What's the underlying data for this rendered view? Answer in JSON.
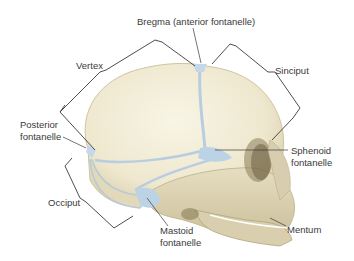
{
  "diagram": {
    "labels": {
      "bregma": "Bregma (anterior fontanelle)",
      "vertex": "Vertex",
      "sinciput": "Sinciput",
      "posterior_1": "Posterior",
      "posterior_2": "fontanelle",
      "sphenoid_1": "Sphenoid",
      "sphenoid_2": "fontanelle",
      "occiput": "Occiput",
      "mastoid_1": "Mastoid",
      "mastoid_2": "fontanelle",
      "mentum": "Mentum"
    },
    "colors": {
      "bone_light": "#f4efdc",
      "bone_mid": "#e4dcbf",
      "bone_dark": "#c9bd98",
      "fontanelle": "#bcd3e6",
      "line": "#3a3a3a"
    }
  }
}
